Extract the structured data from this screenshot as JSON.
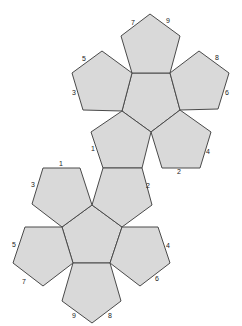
{
  "diagram": {
    "type": "dodecahedron-net",
    "colors": {
      "face_fill": "#d9d9d9",
      "edge_stroke": "#4a4a4a",
      "label": "#222222",
      "background": "#ffffff"
    },
    "upper_group": {
      "faces": [
        {
          "name": "upper-center",
          "points": "132,73 170,73 180,110 151,132 122,111"
        },
        {
          "name": "upper-top",
          "points": "132,73 121,36 150,14 180,36 170,73"
        },
        {
          "name": "upper-left",
          "points": "132,73 122,111 83,110 72,73 102,51"
        },
        {
          "name": "upper-right",
          "points": "170,73 199,51 229,73 218,109 180,110"
        },
        {
          "name": "upper-bottom-right",
          "points": "180,110 211,132 200,168 162,168 151,132"
        },
        {
          "name": "upper-bottom-left",
          "points": "122,111 151,132 142,168 103,168 91,132"
        }
      ],
      "labels": [
        {
          "text": "7",
          "x": 133,
          "y": 23
        },
        {
          "text": "9",
          "x": 168,
          "y": 21
        },
        {
          "text": "5",
          "x": 84,
          "y": 59
        },
        {
          "text": "3",
          "x": 74,
          "y": 93
        },
        {
          "text": "8",
          "x": 217,
          "y": 58
        },
        {
          "text": "6",
          "x": 227,
          "y": 93
        },
        {
          "text": "1",
          "x": 93,
          "y": 149
        },
        {
          "text": "4",
          "x": 208,
          "y": 152
        },
        {
          "text": "2",
          "x": 179,
          "y": 172
        }
      ]
    },
    "lower_group": {
      "faces": [
        {
          "name": "lower-center",
          "points": "92,205 122,227 110,263 73,263 62,227"
        },
        {
          "name": "lower-top-right",
          "points": "103,168 142,168 152,205 122,227 92,205"
        },
        {
          "name": "lower-top-left",
          "points": "43,168 80,168 92,205 62,227 32,204"
        },
        {
          "name": "lower-left",
          "points": "25,227 62,227 73,263 43,286 13,263"
        },
        {
          "name": "lower-right",
          "points": "122,227 158,227 170,263 140,286 110,263"
        },
        {
          "name": "lower-bottom",
          "points": "73,263 110,263 121,301 92,323 62,301"
        }
      ],
      "labels": [
        {
          "text": "1",
          "x": 61,
          "y": 164
        },
        {
          "text": "3",
          "x": 33,
          "y": 185
        },
        {
          "text": "2",
          "x": 148,
          "y": 186
        },
        {
          "text": "5",
          "x": 14,
          "y": 245
        },
        {
          "text": "7",
          "x": 24,
          "y": 282
        },
        {
          "text": "4",
          "x": 168,
          "y": 246
        },
        {
          "text": "6",
          "x": 157,
          "y": 279
        },
        {
          "text": "9",
          "x": 74,
          "y": 316
        },
        {
          "text": "8",
          "x": 110,
          "y": 316
        }
      ]
    }
  }
}
